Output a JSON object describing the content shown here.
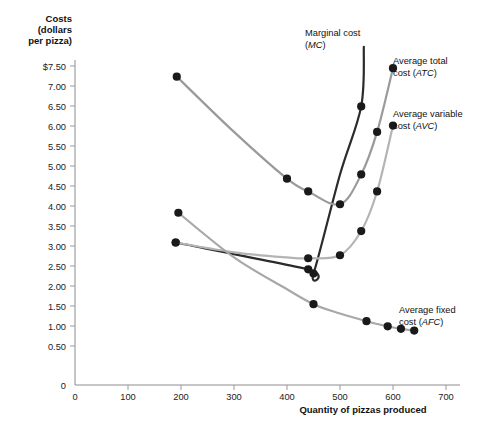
{
  "chart_data": {
    "type": "line",
    "title": "",
    "ylabel": "Costs (dollars per pizza)",
    "ylabel_lines": [
      "Costs",
      "(dollars",
      "per pizza)"
    ],
    "xlabel": "Quantity of pizzas produced",
    "xlim": [
      0,
      750
    ],
    "ylim": [
      0,
      7.9
    ],
    "grid": false,
    "legend_position": "inline-annotations",
    "xticks": [
      0,
      100,
      200,
      300,
      400,
      500,
      600,
      700
    ],
    "xtick_labels": [
      "0",
      "100",
      "200",
      "300",
      "400",
      "500",
      "600",
      "700"
    ],
    "yticks": [
      0,
      0.5,
      1.0,
      1.5,
      2.0,
      2.5,
      3.0,
      3.5,
      4.0,
      4.5,
      5.0,
      5.5,
      6.0,
      6.5,
      7.0,
      7.5
    ],
    "ytick_labels": [
      "0",
      "0.50",
      "1.00",
      "1.50",
      "2.00",
      "2.50",
      "3.00",
      "3.50",
      "4.00",
      "4.50",
      "5.00",
      "5.50",
      "6.00",
      "6.50",
      "7.00",
      "$7.50"
    ],
    "series": [
      {
        "name": "Marginal cost (MC)",
        "key": "mc",
        "label_main": "Marginal cost",
        "label_paren": "(MC)",
        "color": "#2b2b2b",
        "width": 2.2,
        "x": [
          190,
          440,
          450,
          500,
          540,
          545
        ],
        "y": [
          3.35,
          2.72,
          2.62,
          4.95,
          6.55,
          7.95
        ],
        "marker_x": [
          190,
          440,
          450,
          540
        ],
        "marker_y": [
          3.35,
          2.72,
          2.62,
          6.55
        ]
      },
      {
        "name": "Average total cost (ATC)",
        "key": "atc",
        "label_main": "Average total",
        "label_paren": "cost (ATC)",
        "color": "#9a9a9a",
        "width": 2.2,
        "x": [
          192,
          300,
          400,
          440,
          500,
          540,
          570,
          600
        ],
        "y": [
          7.25,
          5.95,
          4.85,
          4.55,
          4.25,
          4.95,
          5.95,
          7.45
        ],
        "marker_x": [
          192,
          400,
          440,
          500,
          540,
          570,
          600
        ],
        "marker_y": [
          7.25,
          4.85,
          4.55,
          4.25,
          4.95,
          5.95,
          7.45
        ]
      },
      {
        "name": "Average variable cost (AVC)",
        "key": "avc",
        "label_main": "Average variable",
        "label_paren": "cost (AVC)",
        "color": "#b4b4b4",
        "width": 2.2,
        "x": [
          190,
          300,
          400,
          440,
          500,
          540,
          570,
          600
        ],
        "y": [
          3.35,
          3.12,
          3.0,
          2.98,
          3.05,
          3.62,
          4.55,
          6.1
        ],
        "marker_x": [
          190,
          440,
          500,
          540,
          570,
          600
        ],
        "marker_y": [
          3.35,
          2.98,
          3.05,
          3.62,
          4.55,
          6.1
        ]
      },
      {
        "name": "Average fixed cost (AFC)",
        "key": "afc",
        "label_main": "Average fixed",
        "label_paren": "cost (AFC)",
        "color": "#a8a8a8",
        "width": 2.2,
        "x": [
          195,
          300,
          400,
          450,
          500,
          550,
          590,
          615,
          640
        ],
        "y": [
          4.05,
          3.0,
          2.25,
          1.9,
          1.68,
          1.5,
          1.38,
          1.32,
          1.28
        ],
        "marker_x": [
          195,
          450,
          550,
          590,
          615,
          640
        ],
        "marker_y": [
          4.05,
          1.9,
          1.5,
          1.38,
          1.32,
          1.28
        ]
      }
    ],
    "annotations": [
      {
        "name": "mc-label",
        "text": "Marginal cost (MC)",
        "x": 305,
        "y": 32
      },
      {
        "name": "atc-label",
        "text": "Average total cost (ATC)",
        "x": 392,
        "y": 58
      },
      {
        "name": "avc-label",
        "text": "Average variable cost (AVC)",
        "x": 392,
        "y": 112
      },
      {
        "name": "afc-label",
        "text": "Average fixed cost (AFC)",
        "x": 398,
        "y": 308
      }
    ]
  },
  "axis": {
    "ylabel_line1": "Costs",
    "ylabel_line2": "(dollars",
    "ylabel_line3": "per pizza)",
    "xlabel": "Quantity of pizzas produced"
  },
  "labels": {
    "mc_main": "Marginal cost",
    "mc_paren_open": "(",
    "mc_abbr": "MC",
    "mc_paren_close": ")",
    "atc_main": "Average total",
    "atc_prefix": "cost (",
    "atc_abbr": "ATC",
    "atc_suffix": ")",
    "avc_main": "Average variable",
    "avc_prefix": "cost (",
    "avc_abbr": "AVC",
    "avc_suffix": ")",
    "afc_main": "Average fixed",
    "afc_prefix": "cost (",
    "afc_abbr": "AFC",
    "afc_suffix": ")"
  },
  "ytick_labels": {
    "t15": "$7.50",
    "t14": "7.00",
    "t13": "6.50",
    "t12": "6.00",
    "t11": "5.50",
    "t10": "5.00",
    "t9": "4.50",
    "t8": "4.00",
    "t7": "3.50",
    "t6": "3.00",
    "t5": "2.50",
    "t4": "2.00",
    "t3": "1.50",
    "t2": "1.00",
    "t1": "0.50",
    "t0": "0"
  },
  "xtick_labels": {
    "x0": "0",
    "x1": "100",
    "x2": "200",
    "x3": "300",
    "x4": "400",
    "x5": "500",
    "x6": "600",
    "x7": "700"
  }
}
